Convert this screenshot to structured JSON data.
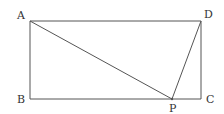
{
  "diagram": {
    "type": "rectangle-with-point",
    "points": {
      "A": {
        "label": "A",
        "x": 30,
        "y": 21,
        "lx": 17,
        "ly": 19
      },
      "B": {
        "label": "B",
        "x": 30,
        "y": 99,
        "lx": 17,
        "ly": 103
      },
      "C": {
        "label": "C",
        "x": 201,
        "y": 99,
        "lx": 206,
        "ly": 103
      },
      "D": {
        "label": "D",
        "x": 201,
        "y": 21,
        "lx": 204,
        "ly": 18
      },
      "P": {
        "label": "P",
        "x": 172,
        "y": 99,
        "lx": 169,
        "ly": 112
      }
    },
    "segments": [
      [
        "A",
        "D"
      ],
      [
        "D",
        "C"
      ],
      [
        "C",
        "B"
      ],
      [
        "B",
        "A"
      ],
      [
        "A",
        "P"
      ],
      [
        "D",
        "P"
      ]
    ],
    "colors": {
      "line": "#555555",
      "text": "#333333"
    }
  }
}
